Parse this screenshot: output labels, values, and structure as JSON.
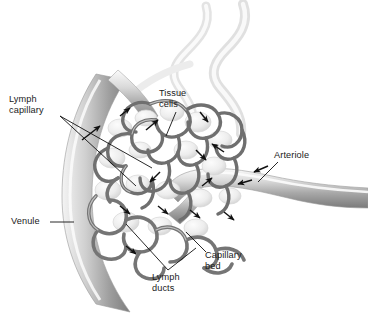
{
  "figure": {
    "style": "grayscale anatomical illustration",
    "background_color": "#ffffff",
    "vessel_color": "#8c8c8c",
    "mesh_color": "#6e6e6e",
    "label_color": "#1a1a1a",
    "leader_color": "#111111"
  },
  "labels": {
    "lymph_capillary": "Lymph\ncapillary",
    "tissue_cells": "Tissue\ncells",
    "arteriole": "Arteriole",
    "venule": "Venule",
    "lymph_ducts": "Lymph\nducts",
    "capillary_bed": "Capillary\nbed"
  }
}
